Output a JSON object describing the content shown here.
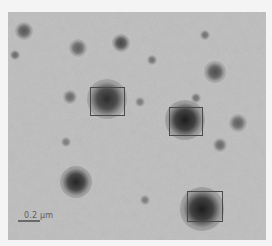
{
  "image": {
    "description": "Grayscale electron micrograph with dark particles; three particles highlighted by rectangular boxes",
    "background_color": "#b9b9b9",
    "page_background": "#f4f4f4",
    "box_color": "#4a4a4a"
  },
  "scale_bar": {
    "label": "0.2 μm"
  },
  "highlight_boxes": [
    {
      "name": "box-particle-1",
      "x": 90,
      "y": 87,
      "w": 35,
      "h": 29
    },
    {
      "name": "box-particle-2",
      "x": 169,
      "y": 107,
      "w": 34,
      "h": 29
    },
    {
      "name": "box-particle-3",
      "x": 187,
      "y": 191,
      "w": 36,
      "h": 31
    }
  ],
  "particles": [
    {
      "x": 107,
      "y": 99,
      "r": 11,
      "dark": 0.85
    },
    {
      "x": 185,
      "y": 120,
      "r": 11,
      "dark": 0.95
    },
    {
      "x": 202,
      "y": 209,
      "r": 12,
      "dark": 0.95
    },
    {
      "x": 76,
      "y": 182,
      "r": 9,
      "dark": 0.9
    },
    {
      "x": 24,
      "y": 31,
      "r": 5,
      "dark": 0.6
    },
    {
      "x": 78,
      "y": 48,
      "r": 5,
      "dark": 0.55
    },
    {
      "x": 121,
      "y": 43,
      "r": 5,
      "dark": 0.7
    },
    {
      "x": 215,
      "y": 72,
      "r": 6,
      "dark": 0.65
    },
    {
      "x": 238,
      "y": 123,
      "r": 5,
      "dark": 0.55
    },
    {
      "x": 220,
      "y": 145,
      "r": 4,
      "dark": 0.5
    },
    {
      "x": 70,
      "y": 97,
      "r": 4,
      "dark": 0.5
    },
    {
      "x": 15,
      "y": 55,
      "r": 3,
      "dark": 0.5
    },
    {
      "x": 152,
      "y": 60,
      "r": 3,
      "dark": 0.45
    },
    {
      "x": 196,
      "y": 98,
      "r": 3,
      "dark": 0.45
    },
    {
      "x": 205,
      "y": 35,
      "r": 3,
      "dark": 0.45
    },
    {
      "x": 140,
      "y": 102,
      "r": 3,
      "dark": 0.4
    },
    {
      "x": 66,
      "y": 142,
      "r": 3,
      "dark": 0.4
    },
    {
      "x": 145,
      "y": 200,
      "r": 3,
      "dark": 0.4
    }
  ]
}
